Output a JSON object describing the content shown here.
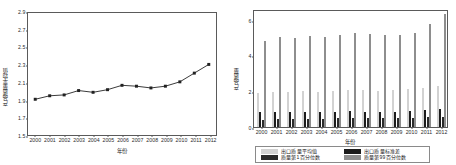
{
  "figure": {
    "background": "#ffffff",
    "axis_color": "#5a5a5a"
  },
  "left_panel": {
    "name": "line-chart-export-quality-average",
    "ytitle": "产品质量平均值",
    "xtitle": "年份"
  },
  "right_panel": {
    "name": "bar-chart-export-quality-distribution",
    "ytitle": "产品质量",
    "xtitle": "年份"
  },
  "legend": {
    "items": [
      {
        "label": "出口质量平均值",
        "color": "#d2d2d2"
      },
      {
        "label": "出口质量标准差",
        "color": "#1c1c1c"
      },
      {
        "label": "质量第1百分位数",
        "color": "#2a2a2a"
      },
      {
        "label": "质量第99百分位数",
        "color": "#8e8e8e"
      }
    ]
  },
  "chart_data": [
    {
      "type": "line",
      "name": "export-quality-average-trend",
      "title": "",
      "xlabel": "年份",
      "ylabel": "产品质量平均值",
      "x": [
        "2000",
        "2001",
        "2002",
        "2003",
        "2004",
        "2005",
        "2006",
        "2007",
        "2008",
        "2009",
        "2010",
        "2011",
        "2012"
      ],
      "values": [
        1.91,
        1.95,
        1.96,
        2.01,
        1.99,
        2.02,
        2.07,
        2.06,
        2.04,
        2.06,
        2.11,
        2.21,
        2.31
      ],
      "ylim": [
        1.5,
        2.9
      ],
      "yticks": [
        1.5,
        1.7,
        1.9,
        2.1,
        2.3,
        2.5,
        2.7,
        2.9
      ],
      "ytick_labels": [
        "1.5",
        "1.7",
        "1.9",
        "2.1",
        "2.3",
        "2.5",
        "2.7",
        "2.9"
      ],
      "grid": false,
      "marker": "square",
      "line_color": "#222222",
      "legend": "none"
    },
    {
      "type": "bar",
      "name": "export-quality-distribution-by-year",
      "title": "",
      "xlabel": "年份",
      "ylabel": "产品质量",
      "categories": [
        "2000",
        "2001",
        "2002",
        "2003",
        "2004",
        "2005",
        "2006",
        "2007",
        "2008",
        "2009",
        "2010",
        "2011",
        "2012"
      ],
      "ylim": [
        0,
        6.6
      ],
      "yticks": [
        0,
        2,
        4,
        6
      ],
      "ytick_labels": [
        "0",
        "2",
        "4",
        "6"
      ],
      "grid": false,
      "legend": "bottom",
      "series": [
        {
          "name": "出口质量平均值",
          "color": "#d2d2d2",
          "values": [
            1.92,
            1.95,
            1.96,
            2.0,
            1.98,
            2.01,
            2.05,
            2.05,
            2.03,
            2.06,
            2.11,
            2.21,
            2.31
          ]
        },
        {
          "name": "出口质量标准差",
          "color": "#1c1c1c",
          "values": [
            0.82,
            0.85,
            0.84,
            0.84,
            0.85,
            0.86,
            0.87,
            0.86,
            0.85,
            0.86,
            0.88,
            0.93,
            1.01
          ]
        },
        {
          "name": "质量第1百分位数",
          "color": "#2a2a2a",
          "values": [
            0.41,
            0.44,
            0.45,
            0.46,
            0.47,
            0.48,
            0.52,
            0.52,
            0.51,
            0.52,
            0.53,
            0.55,
            0.58
          ]
        },
        {
          "name": "质量第99百分位数",
          "color": "#8e8e8e",
          "values": [
            4.83,
            5.02,
            5.0,
            5.1,
            5.04,
            5.14,
            5.24,
            5.2,
            5.12,
            5.12,
            5.27,
            5.76,
            6.31
          ]
        }
      ]
    }
  ]
}
